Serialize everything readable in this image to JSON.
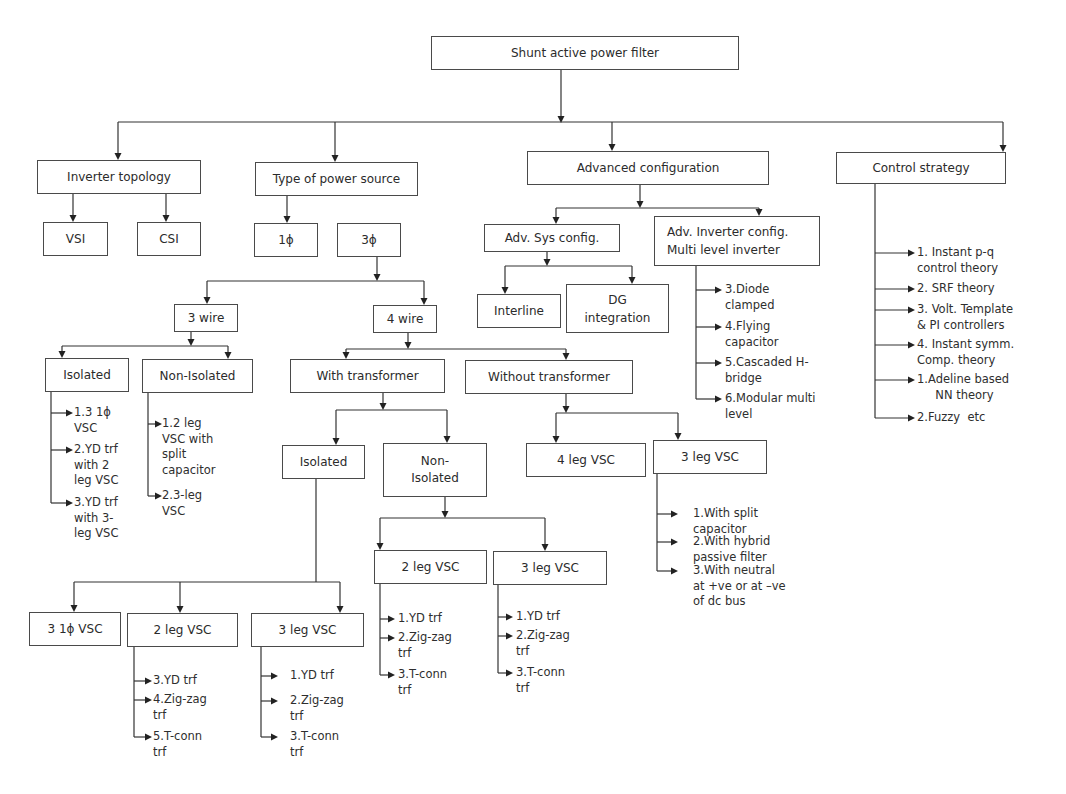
{
  "diagram": {
    "type": "tree",
    "root": "Shunt active power filter",
    "nodes": {
      "root": "Shunt active power filter",
      "inverter_topology": "Inverter topology",
      "vsi": "VSI",
      "csi": "CSI",
      "power_source": "Type of power source",
      "one_phase": "1ϕ",
      "three_phase": "3ϕ",
      "three_wire": "3 wire",
      "four_wire": "4 wire",
      "tw_isolated": "Isolated",
      "tw_non_isolated": "Non-Isolated",
      "with_trf": "With transformer",
      "without_trf": "Without transformer",
      "wt_isolated": "Isolated",
      "wt_non_isolated": "Non-\nIsolated",
      "iso_3_1ph_vsc": "3 1ϕ VSC",
      "iso_2_leg_vsc": "2 leg VSC",
      "iso_3_leg_vsc": "3 leg VSC",
      "non_iso_2_leg_vsc": "2 leg VSC",
      "non_iso_3_leg_vsc": "3 leg VSC",
      "wo_4_leg_vsc": "4 leg VSC",
      "wo_3_leg_vsc": "3 leg VSC",
      "advanced_config": "Advanced configuration",
      "adv_sys_config": "Adv. Sys config.",
      "interline": "Interline",
      "dg_integration": "DG\nintegration",
      "adv_inverter_config": "Adv. Inverter config.\nMulti level inverter",
      "control_strategy": "Control strategy"
    },
    "lists": {
      "tw_isolated": [
        "1.3 1ϕ\nVSC",
        "2.YD trf\nwith 2\nleg VSC",
        "3.YD trf\nwith 3-\nleg VSC"
      ],
      "tw_non_isolated": [
        "1.2 leg\nVSC with\nsplit\ncapacitor",
        "2.3-leg\nVSC"
      ],
      "iso_2_leg_vsc": [
        "3.YD trf",
        "4.Zig-zag\ntrf",
        "5.T-conn\ntrf"
      ],
      "iso_3_leg_vsc": [
        "1.YD trf",
        "2.Zig-zag\ntrf",
        "3.T-conn\ntrf"
      ],
      "non_iso_2_leg_vsc": [
        "1.YD trf",
        "2.Zig-zag\ntrf",
        "3.T-conn\ntrf"
      ],
      "non_iso_3_leg_vsc": [
        "1.YD trf",
        "2.Zig-zag\ntrf",
        "3.T-conn\ntrf"
      ],
      "wo_3_leg_vsc": [
        "1.With split\ncapacitor",
        "2.With hybrid\npassive filter",
        "3.With neutral\nat +ve or at –ve\nof dc bus"
      ],
      "adv_inverter_config": [
        "3.Diode\nclamped",
        "4.Flying\ncapacitor",
        "5.Cascaded H-\nbridge",
        "6.Modular multi\nlevel"
      ],
      "control_strategy": [
        "1. Instant p-q\ncontrol theory",
        "2. SRF theory",
        "3. Volt. Template\n& PI controllers",
        "4. Instant symm.\nComp. theory",
        "1.Adeline based\n     NN theory",
        "2.Fuzzy  etc"
      ]
    }
  }
}
